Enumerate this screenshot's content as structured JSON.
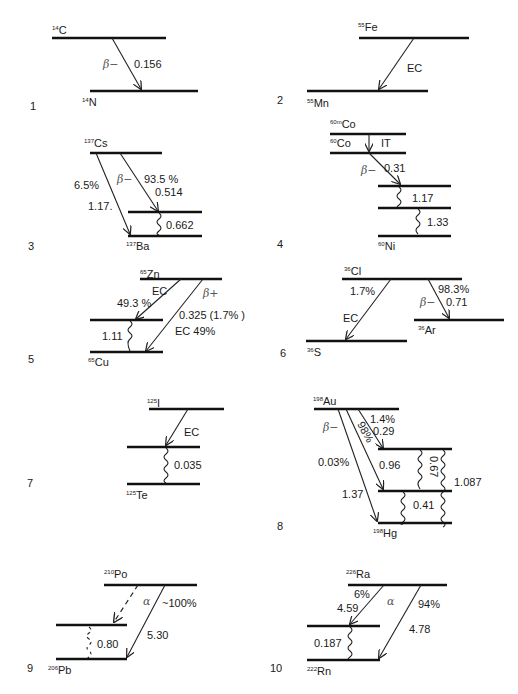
{
  "figure": {
    "panels": [
      {
        "id": "1",
        "parent": {
          "mass": "14",
          "symbol": "C"
        },
        "daughter": {
          "mass": "14",
          "symbol": "N"
        },
        "transitions": [
          {
            "type": "β−",
            "energy": "0.156"
          }
        ]
      },
      {
        "id": "2",
        "parent": {
          "mass": "55",
          "symbol": "Fe"
        },
        "daughter": {
          "mass": "55",
          "symbol": "Mn"
        },
        "transitions": [
          {
            "type": "EC"
          }
        ]
      },
      {
        "id": "3",
        "parent": {
          "mass": "137",
          "symbol": "Cs"
        },
        "daughter": {
          "mass": "137",
          "symbol": "Ba"
        },
        "transitions": [
          {
            "type": "β−",
            "branch": "93.5%",
            "energy": "0.514"
          },
          {
            "type": "β−",
            "branch": "6.5%",
            "energy": "1.17."
          }
        ],
        "gammas": [
          "0.662"
        ]
      },
      {
        "id": "4",
        "parent": {
          "mass": "60m",
          "symbol": "Co"
        },
        "intermediate": {
          "mass": "60",
          "symbol": "Co"
        },
        "daughter": {
          "mass": "60",
          "symbol": "Ni"
        },
        "transitions": [
          {
            "type": "IT"
          },
          {
            "type": "β−",
            "energy": "0.31"
          }
        ],
        "gammas": [
          "1.17",
          "1.33"
        ]
      },
      {
        "id": "5",
        "parent": {
          "mass": "65",
          "symbol": "Zn"
        },
        "daughter": {
          "mass": "65",
          "symbol": "Cu"
        },
        "transitions": [
          {
            "type": "EC",
            "branch": "49.3%"
          },
          {
            "type": "β+",
            "energy": "0.325 (1.7%)"
          },
          {
            "type": "EC",
            "branch": "EC 49%"
          }
        ],
        "gammas": [
          "1.11"
        ]
      },
      {
        "id": "6",
        "parent": {
          "mass": "36",
          "symbol": "Cl"
        },
        "daughters": [
          {
            "mass": "36",
            "symbol": "S"
          },
          {
            "mass": "36",
            "symbol": "Ar"
          }
        ],
        "transitions": [
          {
            "type": "EC",
            "branch": "1.7%"
          },
          {
            "type": "β−",
            "branch": "98.3%",
            "energy": "0.71"
          }
        ]
      },
      {
        "id": "7",
        "parent": {
          "mass": "125",
          "symbol": "I"
        },
        "daughter": {
          "mass": "125",
          "symbol": "Te"
        },
        "transitions": [
          {
            "type": "EC"
          }
        ],
        "gammas": [
          "0.035"
        ]
      },
      {
        "id": "8",
        "parent": {
          "mass": "198",
          "symbol": "Au"
        },
        "daughter": {
          "mass": "198",
          "symbol": "Hg"
        },
        "transitions": [
          {
            "type": "β−"
          },
          {
            "branch": "1.4%",
            "energy": "0.29"
          },
          {
            "branch": "98%",
            "energy": "0.96"
          },
          {
            "branch": "0.03%",
            "energy": "1.37"
          }
        ],
        "gammas": [
          "0.67",
          "1.087",
          "0.41"
        ]
      },
      {
        "id": "9",
        "parent": {
          "mass": "210",
          "symbol": "Po"
        },
        "daughter": {
          "mass": "206",
          "symbol": "Pb"
        },
        "transitions": [
          {
            "type": "α",
            "branch": "~100%",
            "energy": "5.30"
          }
        ],
        "gammas": [
          "0.80"
        ]
      },
      {
        "id": "10",
        "parent": {
          "mass": "226",
          "symbol": "Ra"
        },
        "daughter": {
          "mass": "222",
          "symbol": "Rn"
        },
        "transitions": [
          {
            "type": "α",
            "branch": "6%",
            "energy": "4.59"
          },
          {
            "type": "α",
            "branch": "94%",
            "energy": "4.78"
          }
        ],
        "gammas": [
          "0.187"
        ]
      }
    ]
  },
  "labels": {
    "p1": {
      "num": "1",
      "pm": "14",
      "ps": "C",
      "dm": "14",
      "ds": "N",
      "beta": "β−",
      "e": "0.156"
    },
    "p2": {
      "num": "2",
      "pm": "55",
      "ps": "Fe",
      "dm": "55",
      "ds": "Mn",
      "ec": "EC"
    },
    "p3": {
      "num": "3",
      "pm": "137",
      "ps": "Cs",
      "dm": "137",
      "ds": "Ba",
      "beta": "β−",
      "b1": "93.5 %",
      "e1": "0.514",
      "b2": "6.5%",
      "e2": "1.17.",
      "g": "0.662"
    },
    "p4": {
      "num": "4",
      "pm": "60m",
      "ps": "Co",
      "im": "60",
      "is": "Co",
      "it": "IT",
      "beta": "β−",
      "e": "0.31",
      "g1": "1.17",
      "g2": "1.33",
      "dm": "60",
      "ds": "Ni"
    },
    "p5": {
      "num": "5",
      "pm": "65",
      "ps": "Zn",
      "ec": "EC",
      "b1": "49.3 %",
      "bp": "β+",
      "e2": "0.325 (1.7% )",
      "ec2": "EC 49%",
      "g": "1.11",
      "dm": "65",
      "ds": "Cu"
    },
    "p6": {
      "num": "6",
      "pm": "36",
      "ps": "Cl",
      "b1": "1.7%",
      "ec": "EC",
      "b2": "98.3%",
      "beta": "β−",
      "e": "0.71",
      "d1m": "36",
      "d1s": "S",
      "d2m": "36",
      "d2s": "Ar"
    },
    "p7": {
      "num": "7",
      "pm": "125",
      "ps": "I",
      "ec": "EC",
      "g": "0.035",
      "dm": "125",
      "ds": "Te"
    },
    "p8": {
      "num": "8",
      "pm": "198",
      "ps": "Au",
      "beta": "β−",
      "b1": "1.4%",
      "e1": "0.29",
      "b2": "98%",
      "b3": "0.03%",
      "e2": "0.96",
      "e3": "1.37",
      "g1": "0.67",
      "g2": "1.087",
      "g3": "0.41",
      "dm": "198",
      "ds": "Hg"
    },
    "p9": {
      "num": "9",
      "pm": "210",
      "ps": "Po",
      "alpha": "α",
      "b": "~100%",
      "e": "5.30",
      "g": "0.80",
      "dm": "206",
      "ds": "Pb"
    },
    "p10": {
      "num": "10",
      "pm": "226",
      "ps": "Ra",
      "b1": "6%",
      "e1": "4.59",
      "alpha": "α",
      "b2": "94%",
      "e2": "4.78",
      "g": "0.187",
      "dm": "222",
      "ds": "Rn"
    }
  }
}
